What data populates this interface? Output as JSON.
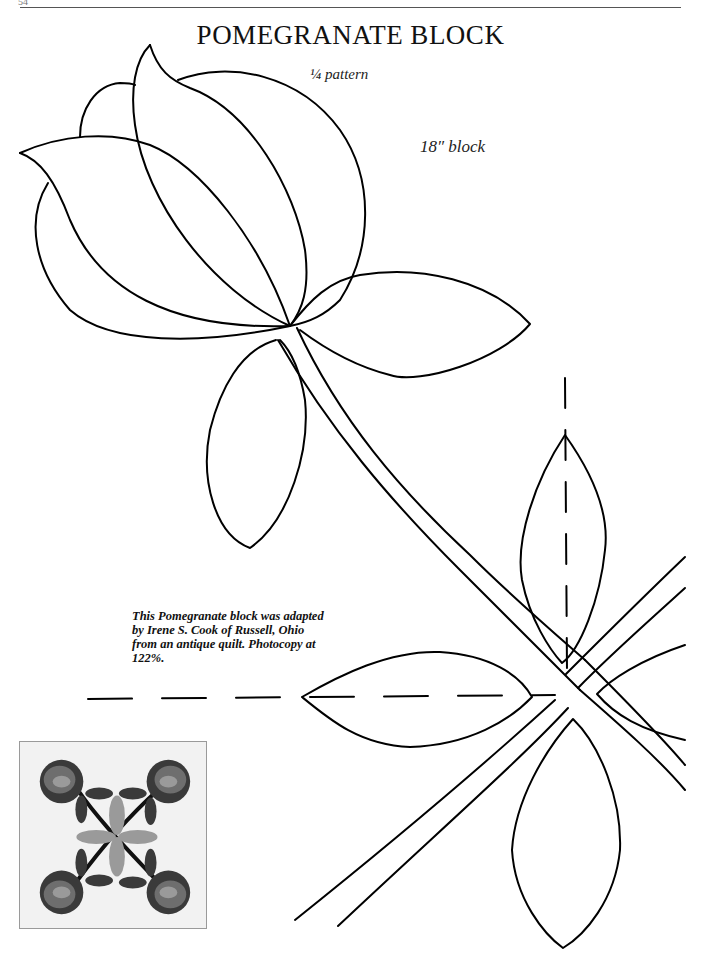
{
  "page": {
    "page_number": "54",
    "title": "POMEGRANATE BLOCK",
    "scale_note": "¼ pattern",
    "block_size": "18″ block",
    "caption": "This Pomegranate block was adapted by Irene S. Cook of Russell, Ohio from an antique quilt. Photocopy at 122%."
  },
  "pattern": {
    "line_color": "#000000",
    "elements": [
      "pomegranate-outline",
      "stem",
      "leaf-upper-right",
      "leaf-lower-left",
      "center-leaf-top",
      "center-leaf-left",
      "center-leaf-bottom",
      "center-cross-stems",
      "fold-line-vertical",
      "fold-line-horizontal"
    ]
  },
  "thumbnail": {
    "description": "Finished quilt block photo",
    "colors": {
      "background": "#f2f2f2",
      "dark_fabric": "#3a3a3a",
      "mid_fabric": "#6e6e6e",
      "light_fabric": "#9a9a9a",
      "stem": "#111111"
    }
  }
}
